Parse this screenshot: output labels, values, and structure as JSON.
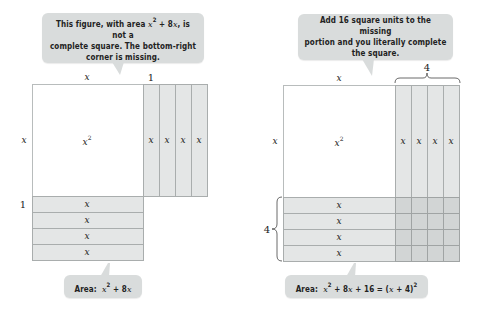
{
  "left_figure": {
    "callout_top": {
      "line1_pre": "This figure, with area ",
      "line1_math": "x",
      "line1_sup": "2",
      "line1_mid": " + 8",
      "line1_math2": "x",
      "line1_post": ", is not a",
      "line2": "complete square. The bottom-right",
      "line3": "corner is missing."
    },
    "top_label_x": "x",
    "top_label_one": "1",
    "side_label_x": "x",
    "side_label_one": "1",
    "square_label": "x",
    "square_sup": "2",
    "vertical_strip_labels": [
      "x",
      "x",
      "x",
      "x"
    ],
    "horizontal_strip_labels": [
      "x",
      "x",
      "x",
      "x"
    ],
    "callout_bottom": {
      "prefix": "Area:",
      "math_x": "x",
      "sup": "2",
      "rest": " + 8",
      "math_x2": "x"
    }
  },
  "right_figure": {
    "callout_top": {
      "line1": "Add 16 square units to the missing",
      "line2": "portion and you literally complete",
      "line3": "the square."
    },
    "top_label_x": "x",
    "top_brace_label": "4",
    "side_label_x": "x",
    "side_brace_label": "4",
    "square_label": "x",
    "square_sup": "2",
    "vertical_strip_labels": [
      "x",
      "x",
      "x",
      "x"
    ],
    "horizontal_strip_labels": [
      "x",
      "x",
      "x",
      "x"
    ],
    "callout_bottom": {
      "prefix": "Area:",
      "math_x": "x",
      "sup": "2",
      "mid": " + 8",
      "math_x2": "x",
      "plus16": " + 16 = (",
      "math_x3": "x",
      "close": " + 4)",
      "sup2": "2"
    }
  },
  "colors": {
    "callout_bg": "#d9dcdc",
    "strip_fill": "#e4e6e6",
    "corner_fill": "#d2d5d5",
    "border": "#a9adad"
  }
}
